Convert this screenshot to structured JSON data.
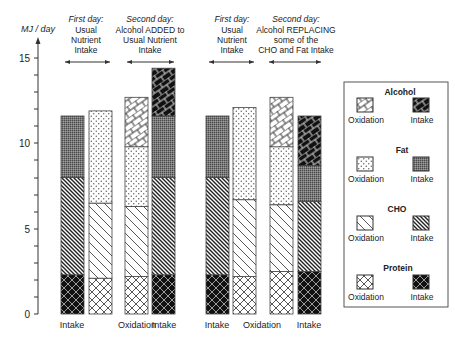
{
  "chart_data": {
    "type": "bar",
    "stacked": true,
    "ylabel": "MJ / day",
    "ylim": [
      0,
      15
    ],
    "yticks": [
      0,
      5,
      10,
      15
    ],
    "grid": false,
    "legend_position": "right",
    "groups": [
      {
        "periods": [
          {
            "label_italic": "First day:",
            "label_lines": [
              "Usual",
              "Nutrient",
              "Intake"
            ]
          },
          {
            "label_italic": "Second day:",
            "label_lines": [
              "Alcohol ADDED to",
              "Usual Nutrient",
              "Intake"
            ]
          }
        ]
      },
      {
        "periods": [
          {
            "label_italic": "First day:",
            "label_lines": [
              "Usual",
              "Nutrient",
              "Intake"
            ]
          },
          {
            "label_italic": "Second day:",
            "label_lines": [
              "Alcohol REPLACING",
              "some of the",
              "CHO and Fat Intake"
            ]
          }
        ]
      }
    ],
    "categories": [
      "Intake",
      "Oxidation",
      "Oxidation",
      "Intake",
      "Intake",
      "Oxidation",
      "Oxidation",
      "Intake"
    ],
    "x_labels": [
      {
        "text": "Intake",
        "x": 72
      },
      {
        "text": "Oxidation",
        "x": 137
      },
      {
        "text": "Intake",
        "x": 164
      },
      {
        "text": "Intake",
        "x": 217
      },
      {
        "text": "Oxidation",
        "x": 262
      },
      {
        "text": "Intake",
        "x": 309
      }
    ],
    "series": [
      {
        "name": "Protein",
        "values": [
          2.3,
          2.1,
          2.2,
          2.3,
          2.3,
          2.2,
          2.5,
          2.5
        ]
      },
      {
        "name": "CHO",
        "values": [
          5.7,
          4.4,
          4.1,
          5.7,
          5.7,
          4.5,
          3.9,
          4.1
        ]
      },
      {
        "name": "Fat",
        "values": [
          3.6,
          5.4,
          3.5,
          3.6,
          3.6,
          5.4,
          3.4,
          2.1
        ]
      },
      {
        "name": "Alcohol",
        "values": [
          0,
          0,
          2.9,
          2.8,
          0,
          0,
          2.9,
          2.9
        ]
      }
    ],
    "bar_kinds": [
      "intake",
      "oxidation",
      "oxidation",
      "intake",
      "intake",
      "oxidation",
      "oxidation",
      "intake"
    ],
    "totals": [
      11.6,
      11.9,
      12.7,
      14.4,
      11.6,
      12.1,
      12.7,
      11.6
    ],
    "legend": [
      {
        "nutrient": "Alcohol",
        "left": "Oxidation",
        "right": "Intake"
      },
      {
        "nutrient": "Fat",
        "left": "Oxidation",
        "right": "Intake"
      },
      {
        "nutrient": "CHO",
        "left": "Oxidation",
        "right": "Intake"
      },
      {
        "nutrient": "Protein",
        "left": "Oxidation",
        "right": "Intake"
      }
    ]
  },
  "axis": {
    "ylabel": "MJ / day",
    "ticks": [
      "0",
      "5",
      "10",
      "15"
    ]
  },
  "headers": {
    "g1p1": {
      "italic": "First day:",
      "l1": "Usual",
      "l2": "Nutrient",
      "l3": "Intake"
    },
    "g1p2": {
      "italic": "Second day:",
      "l1": "Alcohol ADDED to",
      "l2": "Usual Nutrient",
      "l3": "Intake"
    },
    "g2p1": {
      "italic": "First day:",
      "l1": "Usual",
      "l2": "Nutrient",
      "l3": "Intake"
    },
    "g2p2": {
      "italic": "Second day:",
      "l1": "Alcohol REPLACING",
      "l2": "some of the",
      "l3": "CHO and Fat Intake"
    }
  },
  "xlabels": [
    "Intake",
    "Oxidation",
    "Intake",
    "Intake",
    "Oxidation",
    "Intake"
  ],
  "legend": {
    "alcohol": {
      "title": "Alcohol",
      "left": "Oxidation",
      "right": "Intake"
    },
    "fat": {
      "title": "Fat",
      "left": "Oxidation",
      "right": "Intake"
    },
    "cho": {
      "title": "CHO",
      "left": "Oxidation",
      "right": "Intake"
    },
    "protein": {
      "title": "Protein",
      "left": "Oxidation",
      "right": "Intake"
    }
  }
}
